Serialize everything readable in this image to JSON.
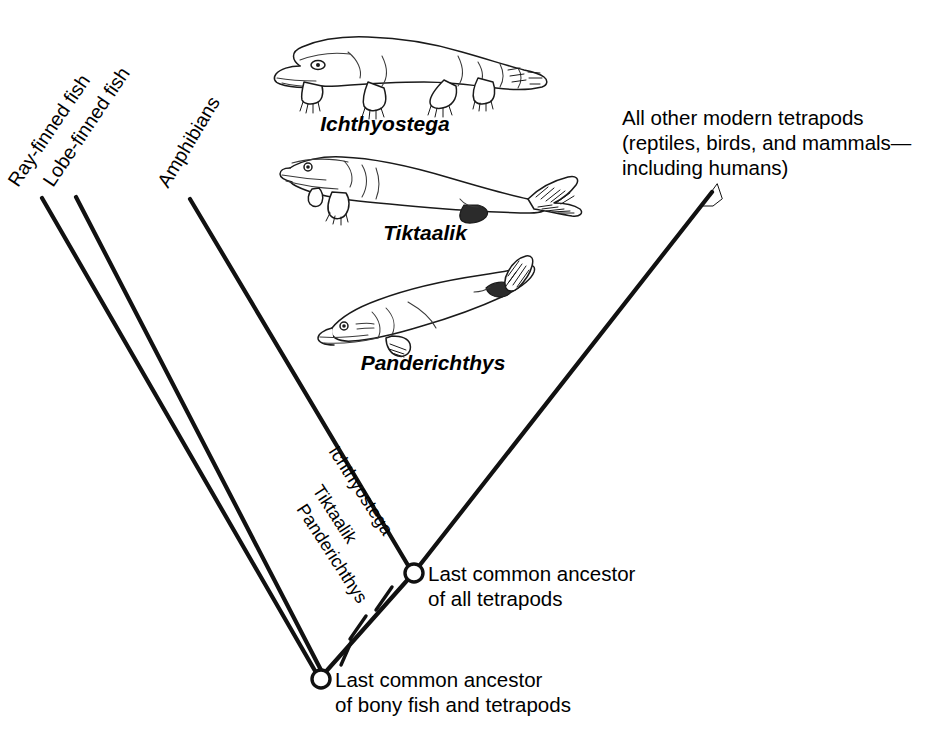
{
  "figure": {
    "type": "cladogram",
    "background_color": "#ffffff",
    "line_color": "#111111"
  },
  "tip_labels": [
    {
      "id": "ray-finned-fish",
      "text": "Ray-finned fish"
    },
    {
      "id": "lobe-finned-fish",
      "text": "Lobe-finned fish"
    },
    {
      "id": "amphibians",
      "text": "Amphibians"
    }
  ],
  "inner_labels": [
    {
      "id": "ichthyostega-branch",
      "text": "Ichthyostega"
    },
    {
      "id": "tiktaalik-branch",
      "text": "Tiktaalik"
    },
    {
      "id": "panderichthys-branch",
      "text": "Panderichthys"
    }
  ],
  "taxon_illustrations": [
    {
      "id": "ichthyostega",
      "name": "Ichthyostega"
    },
    {
      "id": "tiktaalik",
      "name": "Tiktaalik"
    },
    {
      "id": "panderichthys",
      "name": "Panderichthys"
    }
  ],
  "nodes": [
    {
      "id": "tetrapod-ancestor",
      "line1": "Last common ancestor",
      "line2": "of all tetrapods"
    },
    {
      "id": "bony-fish-tetrapod-ancestor",
      "line1": "Last common ancestor",
      "line2": "of bony fish and tetrapods"
    }
  ],
  "callout": {
    "id": "modern-tetrapods",
    "line1": "All other modern tetrapods",
    "line2": "(reptiles, birds, and mammals—",
    "line3": "including humans)"
  }
}
